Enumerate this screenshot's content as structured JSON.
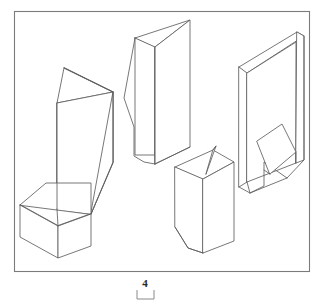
{
  "figure": {
    "caption_number": "4",
    "frame": {
      "x": 14,
      "y": 11,
      "width": 296,
      "height": 261,
      "stroke_color": "#7b7b7b"
    },
    "scale_bar": {
      "x": 137,
      "y": 290,
      "width": 17,
      "height": 9,
      "stroke_color": "#8a8a8a"
    },
    "line_color": "#5e5e5e",
    "fill_color": "#ffffff",
    "background_color": "#ffffff",
    "object_count": 4,
    "objects": [
      {
        "name": "tall-prism-with-wedge-top-and-base-block",
        "position": "left",
        "description": "Tall upright quadrilateral prism topped by a slanted triangular wedge, with a rectangular block attached at its lower-left base"
      },
      {
        "name": "tall-wedge-prism-with-stepped-profile",
        "position": "upper-center",
        "description": "Tall prism with a slanted triangular top face and a stepped concave left profile"
      },
      {
        "name": "short-prism-with-fin",
        "position": "lower-center",
        "description": "Upright rectangular prism with a thin triangular fin at the top and a tapered lower-left corner"
      },
      {
        "name": "hollow-channel-with-flap",
        "position": "right",
        "description": "Tall open U-channel solid viewed from inside, containing a slanted rectangular flap near its base"
      }
    ]
  }
}
